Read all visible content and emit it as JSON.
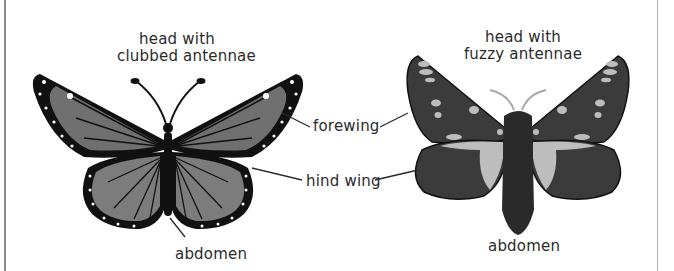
{
  "diagram": {
    "butterfly": {
      "head_label_line1": "head with",
      "head_label_line2": "clubbed antennae",
      "abdomen_label": "abdomen"
    },
    "moth": {
      "head_label_line1": "head with",
      "head_label_line2": "fuzzy antennae",
      "abdomen_label": "abdomen"
    },
    "shared_labels": {
      "forewing": "forewing",
      "hind_wing": "hind wing"
    }
  },
  "colors": {
    "outline": "#111111",
    "wing_fill": "#6f6f6f",
    "hindwing_fill": "#7c7c7c",
    "moth_wing": "#3b3b3b",
    "moth_spot": "#bdbdbd",
    "text": "#2b2b2b",
    "leader_line": "#2b2b2b"
  }
}
